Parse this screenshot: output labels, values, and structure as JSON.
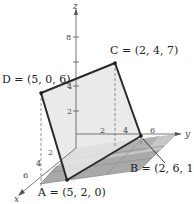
{
  "figure": {
    "type": "3d-coordinate-diagram",
    "axes": {
      "x": {
        "label": "x",
        "ticks": [
          "2",
          "4",
          "6"
        ]
      },
      "y": {
        "label": "y",
        "ticks": [
          "2",
          "4",
          "6"
        ]
      },
      "z": {
        "label": "z",
        "ticks": [
          "2",
          "4",
          "6",
          "8"
        ]
      }
    },
    "points": [
      {
        "name": "A",
        "coords": "(5, 2, 0)",
        "label": "A = (5, 2, 0)"
      },
      {
        "name": "B",
        "coords": "(2, 6, 1)",
        "label": "B = (2, 6, 1)"
      },
      {
        "name": "C",
        "coords": "(2, 4, 7)",
        "label": "C = (2, 4, 7)"
      },
      {
        "name": "D",
        "coords": "(5, 0, 6)",
        "label": "D = (5, 0, 6)"
      }
    ],
    "colors": {
      "plane_fill": "#e4e4e4",
      "floor_fill": "#a8a8a8",
      "floor_light": "#c4c4c4",
      "edge": "#2a2a2a",
      "axis": "#555555"
    }
  }
}
